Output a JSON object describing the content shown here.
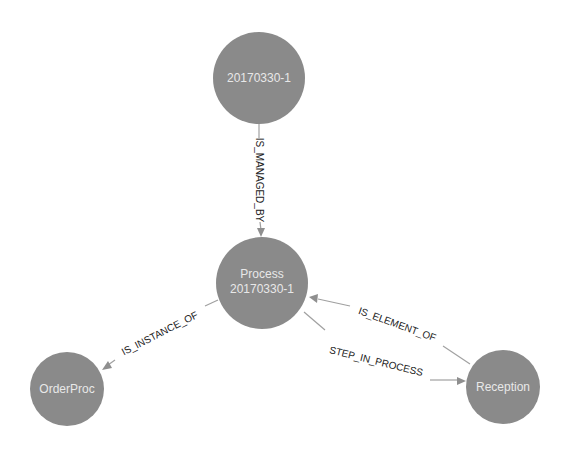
{
  "graph": {
    "colors": {
      "node_fill": "#8a8a8a",
      "node_text": "#e8e8e8",
      "edge": "#a0a0a0",
      "edge_label": "#222222",
      "background": "#ffffff"
    },
    "nodes": [
      {
        "id": "top",
        "label_lines": [
          "20170330-1"
        ],
        "label": "20170330-1"
      },
      {
        "id": "process",
        "label_lines": [
          "Process",
          "20170330-1"
        ],
        "label": "Process 20170330-1"
      },
      {
        "id": "orderproc",
        "label_lines": [
          "OrderProc"
        ],
        "label": "OrderProc"
      },
      {
        "id": "reception",
        "label_lines": [
          "Reception"
        ],
        "label": "Reception"
      }
    ],
    "edges": [
      {
        "from": "20170330-1",
        "to": "Process 20170330-1",
        "label": "IS_MANAGED_BY"
      },
      {
        "from": "Process 20170330-1",
        "to": "OrderProc",
        "label": "IS_INSTANCE_OF"
      },
      {
        "from": "Reception",
        "to": "Process 20170330-1",
        "label": "IS_ELEMENT_OF"
      },
      {
        "from": "Process 20170330-1",
        "to": "Reception",
        "label": "STEP_IN_PROCESS"
      }
    ]
  }
}
